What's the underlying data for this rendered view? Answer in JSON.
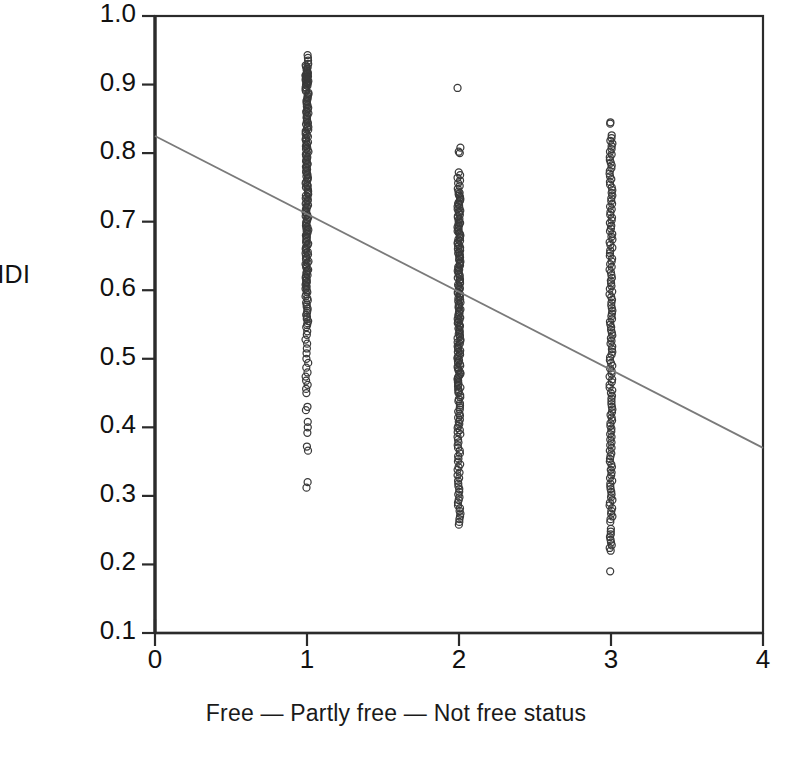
{
  "chart_data": {
    "type": "scatter",
    "title": "",
    "xlabel": "Free — Partly free — Not free status",
    "ylabel": "HDI",
    "ylabel_visible": "HDI",
    "xlim": [
      0,
      4
    ],
    "ylim": [
      0.1,
      1.0
    ],
    "xticks": [
      0,
      1,
      2,
      3,
      4
    ],
    "xtick_labels": [
      "0",
      "1",
      "2",
      "3",
      "4"
    ],
    "yticks": [
      0.1,
      0.2,
      0.3,
      0.4,
      0.5,
      0.6,
      0.7,
      0.8,
      0.9,
      1.0
    ],
    "ytick_labels": [
      "0.1",
      "0.2",
      "0.3",
      "0.4",
      "0.5",
      "0.6",
      "0.7",
      "0.8",
      "0.9",
      "1.0"
    ],
    "grid": false,
    "legend": null,
    "marker": "open-circle",
    "marker_color": "#3a3a3a",
    "marker_size_px": 7,
    "frame_color": "#2b2b2b",
    "line_color": "#7a7a7a",
    "series": [
      {
        "name": "Free (status = 1)",
        "x_category": 1,
        "values": [
          0.943,
          0.939,
          0.935,
          0.93,
          0.928,
          0.926,
          0.925,
          0.923,
          0.921,
          0.92,
          0.918,
          0.917,
          0.916,
          0.915,
          0.914,
          0.913,
          0.912,
          0.911,
          0.91,
          0.909,
          0.908,
          0.907,
          0.906,
          0.905,
          0.904,
          0.903,
          0.902,
          0.901,
          0.9,
          0.898,
          0.896,
          0.894,
          0.892,
          0.89,
          0.888,
          0.886,
          0.884,
          0.882,
          0.88,
          0.878,
          0.876,
          0.874,
          0.872,
          0.87,
          0.868,
          0.866,
          0.864,
          0.862,
          0.86,
          0.858,
          0.856,
          0.854,
          0.852,
          0.85,
          0.848,
          0.846,
          0.844,
          0.842,
          0.84,
          0.838,
          0.836,
          0.834,
          0.832,
          0.83,
          0.828,
          0.826,
          0.824,
          0.822,
          0.82,
          0.818,
          0.816,
          0.814,
          0.812,
          0.81,
          0.808,
          0.806,
          0.804,
          0.802,
          0.8,
          0.798,
          0.796,
          0.794,
          0.792,
          0.79,
          0.788,
          0.786,
          0.784,
          0.782,
          0.78,
          0.778,
          0.776,
          0.774,
          0.772,
          0.77,
          0.768,
          0.766,
          0.764,
          0.762,
          0.76,
          0.758,
          0.756,
          0.754,
          0.752,
          0.75,
          0.748,
          0.746,
          0.744,
          0.742,
          0.74,
          0.738,
          0.736,
          0.734,
          0.732,
          0.73,
          0.728,
          0.726,
          0.724,
          0.722,
          0.72,
          0.718,
          0.716,
          0.714,
          0.712,
          0.71,
          0.708,
          0.706,
          0.704,
          0.702,
          0.7,
          0.698,
          0.696,
          0.694,
          0.692,
          0.69,
          0.688,
          0.686,
          0.684,
          0.682,
          0.68,
          0.678,
          0.676,
          0.674,
          0.672,
          0.67,
          0.668,
          0.666,
          0.664,
          0.662,
          0.66,
          0.658,
          0.656,
          0.654,
          0.652,
          0.65,
          0.648,
          0.646,
          0.644,
          0.642,
          0.64,
          0.638,
          0.636,
          0.634,
          0.632,
          0.63,
          0.628,
          0.626,
          0.624,
          0.622,
          0.62,
          0.618,
          0.616,
          0.614,
          0.612,
          0.61,
          0.608,
          0.606,
          0.604,
          0.602,
          0.6,
          0.597,
          0.594,
          0.591,
          0.588,
          0.585,
          0.582,
          0.579,
          0.576,
          0.573,
          0.57,
          0.567,
          0.564,
          0.561,
          0.558,
          0.555,
          0.552,
          0.549,
          0.546,
          0.54,
          0.535,
          0.528,
          0.522,
          0.515,
          0.508,
          0.5,
          0.494,
          0.487,
          0.48,
          0.474,
          0.468,
          0.462,
          0.456,
          0.45,
          0.43,
          0.425,
          0.408,
          0.4,
          0.392,
          0.372,
          0.366,
          0.32,
          0.312
        ]
      },
      {
        "name": "Partly free (status = 2)",
        "x_category": 2,
        "values": [
          0.895,
          0.808,
          0.802,
          0.8,
          0.772,
          0.768,
          0.764,
          0.76,
          0.756,
          0.752,
          0.748,
          0.744,
          0.742,
          0.74,
          0.738,
          0.736,
          0.734,
          0.732,
          0.73,
          0.728,
          0.726,
          0.724,
          0.722,
          0.72,
          0.718,
          0.716,
          0.714,
          0.712,
          0.71,
          0.708,
          0.706,
          0.704,
          0.702,
          0.7,
          0.698,
          0.696,
          0.694,
          0.692,
          0.69,
          0.688,
          0.686,
          0.684,
          0.682,
          0.68,
          0.678,
          0.676,
          0.674,
          0.672,
          0.67,
          0.668,
          0.666,
          0.664,
          0.662,
          0.66,
          0.658,
          0.656,
          0.654,
          0.652,
          0.65,
          0.648,
          0.646,
          0.644,
          0.642,
          0.64,
          0.638,
          0.636,
          0.634,
          0.632,
          0.63,
          0.628,
          0.626,
          0.624,
          0.622,
          0.62,
          0.618,
          0.616,
          0.614,
          0.612,
          0.61,
          0.608,
          0.606,
          0.604,
          0.602,
          0.6,
          0.598,
          0.596,
          0.594,
          0.592,
          0.59,
          0.588,
          0.586,
          0.584,
          0.582,
          0.58,
          0.578,
          0.576,
          0.574,
          0.572,
          0.57,
          0.568,
          0.566,
          0.564,
          0.562,
          0.56,
          0.558,
          0.556,
          0.554,
          0.552,
          0.55,
          0.548,
          0.546,
          0.544,
          0.542,
          0.54,
          0.538,
          0.536,
          0.534,
          0.532,
          0.53,
          0.528,
          0.526,
          0.524,
          0.522,
          0.52,
          0.518,
          0.516,
          0.514,
          0.512,
          0.51,
          0.508,
          0.506,
          0.504,
          0.502,
          0.5,
          0.498,
          0.496,
          0.494,
          0.492,
          0.49,
          0.488,
          0.486,
          0.484,
          0.482,
          0.48,
          0.478,
          0.476,
          0.474,
          0.472,
          0.47,
          0.468,
          0.466,
          0.464,
          0.462,
          0.46,
          0.458,
          0.456,
          0.454,
          0.452,
          0.45,
          0.447,
          0.444,
          0.441,
          0.438,
          0.435,
          0.432,
          0.429,
          0.426,
          0.423,
          0.42,
          0.417,
          0.414,
          0.411,
          0.408,
          0.405,
          0.402,
          0.399,
          0.396,
          0.393,
          0.39,
          0.386,
          0.382,
          0.378,
          0.374,
          0.37,
          0.366,
          0.362,
          0.358,
          0.354,
          0.35,
          0.346,
          0.342,
          0.338,
          0.334,
          0.33,
          0.326,
          0.322,
          0.318,
          0.314,
          0.31,
          0.306,
          0.302,
          0.298,
          0.294,
          0.29,
          0.286,
          0.282,
          0.278,
          0.274,
          0.27,
          0.266,
          0.262,
          0.258
        ]
      },
      {
        "name": "Not free (status = 3)",
        "x_category": 3,
        "values": [
          0.845,
          0.843,
          0.826,
          0.822,
          0.818,
          0.814,
          0.81,
          0.806,
          0.802,
          0.798,
          0.794,
          0.79,
          0.786,
          0.782,
          0.778,
          0.774,
          0.77,
          0.766,
          0.762,
          0.758,
          0.754,
          0.75,
          0.746,
          0.742,
          0.738,
          0.734,
          0.73,
          0.726,
          0.722,
          0.718,
          0.714,
          0.71,
          0.706,
          0.702,
          0.698,
          0.694,
          0.69,
          0.686,
          0.682,
          0.678,
          0.674,
          0.67,
          0.666,
          0.662,
          0.658,
          0.654,
          0.65,
          0.646,
          0.642,
          0.638,
          0.634,
          0.63,
          0.626,
          0.622,
          0.618,
          0.614,
          0.61,
          0.606,
          0.602,
          0.598,
          0.594,
          0.59,
          0.586,
          0.582,
          0.578,
          0.574,
          0.57,
          0.566,
          0.562,
          0.558,
          0.554,
          0.55,
          0.546,
          0.542,
          0.538,
          0.534,
          0.53,
          0.526,
          0.522,
          0.518,
          0.514,
          0.51,
          0.506,
          0.502,
          0.498,
          0.494,
          0.49,
          0.486,
          0.482,
          0.478,
          0.474,
          0.47,
          0.466,
          0.462,
          0.458,
          0.454,
          0.45,
          0.446,
          0.442,
          0.438,
          0.434,
          0.43,
          0.426,
          0.422,
          0.418,
          0.414,
          0.41,
          0.406,
          0.402,
          0.398,
          0.394,
          0.39,
          0.386,
          0.382,
          0.378,
          0.374,
          0.37,
          0.366,
          0.362,
          0.358,
          0.354,
          0.35,
          0.346,
          0.342,
          0.338,
          0.334,
          0.33,
          0.326,
          0.322,
          0.318,
          0.314,
          0.31,
          0.306,
          0.302,
          0.298,
          0.294,
          0.29,
          0.286,
          0.282,
          0.278,
          0.274,
          0.27,
          0.266,
          0.262,
          0.252,
          0.248,
          0.244,
          0.24,
          0.236,
          0.232,
          0.228,
          0.224,
          0.22,
          0.19
        ]
      }
    ],
    "trendline": {
      "name": "linear fit",
      "x0": 0,
      "y0": 0.825,
      "x1": 4,
      "y1": 0.37,
      "slope": -0.114,
      "intercept": 0.825
    }
  }
}
